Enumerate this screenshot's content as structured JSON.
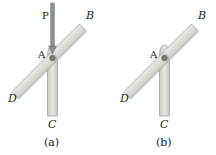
{
  "figure": {
    "panels": [
      {
        "id": "a",
        "caption": "(a)",
        "labels": {
          "P": "P",
          "A": "A",
          "B": "B",
          "C": "C",
          "D": "D"
        },
        "has_force_P": true
      },
      {
        "id": "b",
        "caption": "(b)",
        "labels": {
          "A": "A",
          "B": "B",
          "C": "C",
          "D": "D"
        },
        "has_force_P": false
      }
    ],
    "colors": {
      "bar_fill": "#d8d8d6",
      "bar_edge": "#9a9a98",
      "rod": "#8a8a88",
      "pin": "#666666"
    }
  }
}
